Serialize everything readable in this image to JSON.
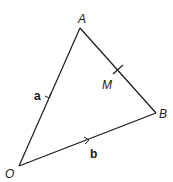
{
  "diagram": {
    "type": "vector-triangle",
    "stroke_color": "#1a1a1a",
    "points": {
      "O": {
        "label": "O",
        "x": 19,
        "y": 166
      },
      "A": {
        "label": "A",
        "x": 80,
        "y": 28
      },
      "B": {
        "label": "B",
        "x": 156,
        "y": 113
      },
      "M": {
        "label": "M",
        "x": 118,
        "y": 70
      }
    },
    "vectors": {
      "a": {
        "label": "a",
        "from": "O",
        "to": "A"
      },
      "b": {
        "label": "b",
        "from": "O",
        "to": "B"
      }
    },
    "segments": [
      {
        "from": "O",
        "to": "A"
      },
      {
        "from": "A",
        "to": "B"
      },
      {
        "from": "O",
        "to": "B"
      }
    ],
    "marks": [
      {
        "type": "midpoint-tick",
        "on": "AB",
        "point": "M"
      }
    ]
  }
}
